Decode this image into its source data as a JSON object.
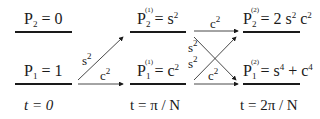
{
  "diagram": {
    "columns": [
      {
        "time_label": "t = 0",
        "top_level": {
          "symbol": "P",
          "index": "2",
          "order": "",
          "rhs": "= 0"
        },
        "bottom_level": {
          "symbol": "P",
          "index": "1",
          "order": "",
          "rhs": "= 1"
        }
      },
      {
        "time_label": "t = π / N",
        "top_level": {
          "symbol": "P",
          "index": "2",
          "order": "(1)",
          "rhs": "= s",
          "rhs_exp": "2"
        },
        "bottom_level": {
          "symbol": "P",
          "index": "1",
          "order": "(1)",
          "rhs": "= c",
          "rhs_exp": "2"
        }
      },
      {
        "time_label": "t = 2π / N",
        "top_level": {
          "symbol": "P",
          "index": "2",
          "order": "(2)",
          "rhs": "= 2 s",
          "rhs_exp": "2",
          "rhs2": " c",
          "rhs2_exp": "2"
        },
        "bottom_level": {
          "symbol": "P",
          "index": "1",
          "order": "(2)",
          "rhs": "= s",
          "rhs_exp": "4",
          "rhs2": "+ c",
          "rhs2_exp": "4"
        }
      }
    ],
    "transitions": {
      "step1": {
        "diag_weight": "s",
        "diag_exp": "2",
        "straight_weight": "c",
        "straight_exp": "2"
      },
      "step2": {
        "top_straight": "c",
        "top_straight_exp": "2",
        "cross_upper": "s",
        "cross_upper_exp": "2",
        "cross_lower": "s",
        "cross_lower_exp": "2",
        "bottom_straight": "c",
        "bottom_straight_exp": "2"
      }
    },
    "colors": {
      "ink": "#1a1a1a",
      "background": "#ffffff"
    }
  }
}
